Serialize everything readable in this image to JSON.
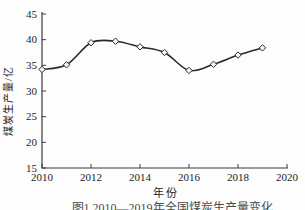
{
  "chart_data": {
    "type": "line",
    "title": "",
    "xlabel": "年份",
    "ylabel": "煤炭生产量/亿",
    "x": [
      2010,
      2011,
      2012,
      2013,
      2014,
      2015,
      2016,
      2017,
      2018,
      2019
    ],
    "series": [
      {
        "name": "煤炭生产量",
        "values": [
          34.2,
          35.1,
          39.4,
          39.7,
          38.6,
          37.5,
          34.0,
          35.2,
          37.0,
          38.4
        ]
      }
    ],
    "xlim": [
      2010,
      2020
    ],
    "ylim": [
      15,
      45
    ],
    "x_ticks": [
      "2010",
      "2012",
      "2014",
      "2016",
      "2018",
      "2020"
    ],
    "x_tick_values": [
      2010,
      2012,
      2014,
      2016,
      2018,
      2020
    ],
    "y_ticks": [
      "45",
      "40",
      "35",
      "30",
      "25",
      "20",
      "15"
    ],
    "y_tick_values": [
      45,
      40,
      35,
      30,
      25,
      20,
      15
    ],
    "grid": false,
    "legend": "none",
    "marker": "open-diamond",
    "line_color": "#2b2b2b",
    "marker_fill": "#f7f7f7",
    "axis_color": "#3c3c3c",
    "smooth": true
  },
  "caption": {
    "text": "图1 2010—2019年全国煤炭生产量变化"
  }
}
